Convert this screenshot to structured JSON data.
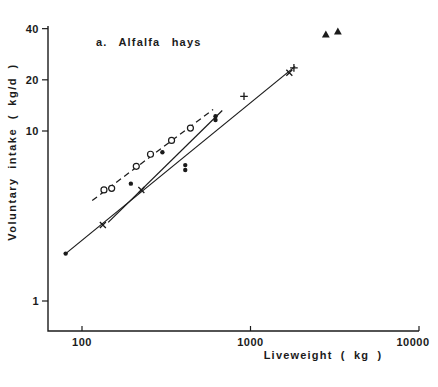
{
  "figure": {
    "background": "#ffffff",
    "ink": "#1b1b1b"
  },
  "chart_data": {
    "type": "scatter",
    "title": "a. Alfalfa hays",
    "xlabel": "Liveweight ( kg )",
    "ylabel": "Voluntary intake ( kg/d )",
    "x_scale": "log",
    "y_scale": "log",
    "xlim": [
      63,
      10000
    ],
    "ylim": [
      0.66,
      45
    ],
    "x_ticks": [
      100,
      1000,
      10000
    ],
    "y_ticks": [
      40,
      20,
      10,
      1
    ],
    "grid": false,
    "legend": false,
    "series": [
      {
        "name": "open-circles",
        "marker": "circle-open",
        "points": [
          [
            135,
            4.5
          ],
          [
            150,
            4.6
          ],
          [
            210,
            6.2
          ],
          [
            255,
            7.3
          ],
          [
            340,
            8.8
          ],
          [
            440,
            10.4
          ]
        ]
      },
      {
        "name": "filled-circles",
        "marker": "circle-filled",
        "points": [
          [
            80,
            1.9
          ],
          [
            195,
            4.9
          ],
          [
            300,
            7.5
          ],
          [
            410,
            6.3
          ],
          [
            410,
            5.9
          ],
          [
            620,
            12.2
          ],
          [
            620,
            11.6
          ]
        ]
      },
      {
        "name": "x-markers",
        "marker": "x",
        "points": [
          [
            133,
            2.8
          ],
          [
            225,
            4.5
          ],
          [
            1700,
            22
          ]
        ]
      },
      {
        "name": "plus-markers",
        "marker": "plus",
        "points": [
          [
            915,
            16
          ],
          [
            1810,
            23.5
          ]
        ]
      },
      {
        "name": "triangles",
        "marker": "triangle-filled",
        "points": [
          [
            2800,
            37
          ],
          [
            3300,
            38.5
          ]
        ]
      }
    ],
    "lines": [
      {
        "name": "long-solid-regression",
        "style": "solid",
        "from": [
          80,
          1.9
        ],
        "to": [
          1840,
          24
        ]
      },
      {
        "name": "short-solid-regression",
        "style": "solid",
        "from": [
          143,
          2.9
        ],
        "to": [
          680,
          13.2
        ]
      },
      {
        "name": "dashed-regression",
        "style": "dashed",
        "from": [
          115,
          3.9
        ],
        "to": [
          600,
          13.4
        ]
      }
    ],
    "layout": {
      "axis_color": "#1b1b1b",
      "legend_position": "none",
      "plot": {
        "y_axis_x": 48,
        "y_axis_top": 26,
        "x_axis_y": 331,
        "x_axis_end": 419,
        "x_ref_val": 100,
        "x_ref_px": 82,
        "x_decade_px": 168.5,
        "y_ref_val": 1,
        "y_ref_px": 301,
        "y_decade_px": 170,
        "x_label_max_center_px": 413
      }
    }
  }
}
